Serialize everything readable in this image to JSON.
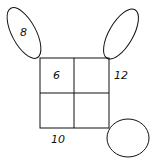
{
  "diagram": {
    "top_left_oval": "8",
    "top_right_oval": "",
    "bottom_right_oval": "",
    "cell_top_left": "6",
    "cell_top_right": "",
    "cell_bottom_left": "",
    "cell_bottom_right": "",
    "right_side_label": "12",
    "bottom_side_label": "10"
  },
  "colors": {
    "stroke": "#111111",
    "background": "#ffffff"
  }
}
